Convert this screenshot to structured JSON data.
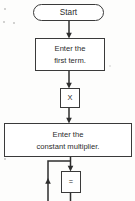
{
  "diagram": {
    "type": "flowchart",
    "background_color": "#fdfdfc",
    "stroke_color": "#3a3a3a",
    "text_color": "#2b2b2b",
    "nodes": [
      {
        "id": "start",
        "shape": "terminator",
        "label": "Start",
        "x": 33,
        "y": 4,
        "width": 71,
        "height": 17
      },
      {
        "id": "enter-first-term",
        "shape": "process",
        "label_line1": "Enter the",
        "label_line2": "first term.",
        "x": 35,
        "y": 38,
        "width": 70,
        "height": 33
      },
      {
        "id": "multiply-key",
        "shape": "key",
        "label": "X",
        "x": 60,
        "y": 88,
        "width": 20,
        "height": 20
      },
      {
        "id": "enter-constant-multiplier",
        "shape": "process",
        "label_line1": "Enter the",
        "label_line2": "constant multiplier.",
        "x": 4,
        "y": 123,
        "width": 128,
        "height": 34
      },
      {
        "id": "equals-key",
        "shape": "key",
        "label": "=",
        "x": 61,
        "y": 171,
        "width": 20,
        "height": 22
      }
    ],
    "connectors": [
      {
        "id": "start-to-first-term",
        "from": "start",
        "to": "enter-first-term",
        "direction": "down",
        "arrow": true
      },
      {
        "id": "first-term-to-multiply-key",
        "from": "enter-first-term",
        "to": "multiply-key",
        "direction": "down",
        "arrow": true
      },
      {
        "id": "multiply-key-to-constant",
        "from": "multiply-key",
        "to": "enter-constant-multiplier",
        "direction": "down",
        "arrow": true
      },
      {
        "id": "constant-to-equals-key",
        "from": "enter-constant-multiplier",
        "to": "equals-key",
        "direction": "down",
        "arrow": true
      },
      {
        "id": "loop-back-branch",
        "from": "enter-constant-multiplier",
        "to": "loop-left",
        "direction": "left-up",
        "arrow": true
      },
      {
        "id": "equals-key-outflow",
        "from": "equals-key",
        "to": "below-frame",
        "direction": "down",
        "arrow": false
      },
      {
        "id": "loop-left-outflow",
        "from": "below-frame",
        "to": "loop-left",
        "direction": "up",
        "arrow": true
      }
    ]
  }
}
